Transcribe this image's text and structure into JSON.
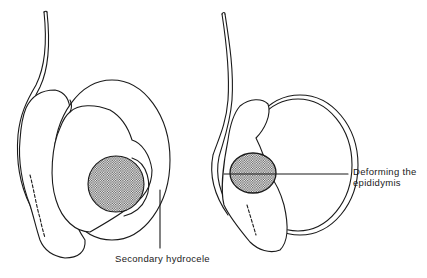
{
  "figure": {
    "panels": [
      {
        "id": "left",
        "description": "Testis with tumour and secondary hydrocele",
        "label": "Secondary hydrocele"
      },
      {
        "id": "right",
        "description": "Testis with tumour deforming the epididymis",
        "label_line1": "Deforming the",
        "label_line2": "epididymis"
      }
    ],
    "colors": {
      "line": "#1a1a1a",
      "background": "#ffffff",
      "stipple": "#555555"
    }
  }
}
